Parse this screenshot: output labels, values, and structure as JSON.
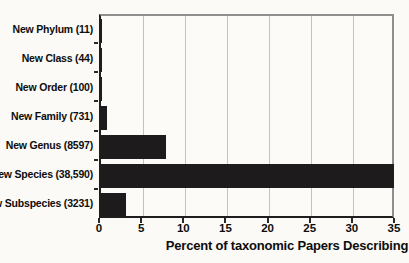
{
  "chart_data": {
    "type": "bar",
    "orientation": "horizontal",
    "title": "",
    "categories": [
      "New Phylum (11)",
      "New Class (44)",
      "New Order (100)",
      "New Family (731)",
      "New Genus (8597)",
      "New Species (38,590)",
      "New Subspecies (3231)"
    ],
    "values": [
      0.01,
      0.04,
      0.09,
      0.66,
      7.75,
      34.8,
      2.91
    ],
    "xlabel": "Percent of taxonomic Papers Describing",
    "ylabel": "",
    "xlim": [
      0,
      35
    ],
    "xticks": [
      0,
      5,
      10,
      15,
      20,
      25,
      30,
      35
    ],
    "grid": "vertical",
    "legend": "none",
    "bar_color": "#1d1b1b"
  },
  "colors": {
    "background": "#fbfaf6",
    "bar": "#1d1b1b",
    "gridline": "#c2c2c2",
    "axis_dark": "#1f1d1d",
    "border_light": "#8f8f8f",
    "text": "#0e0d0d"
  }
}
